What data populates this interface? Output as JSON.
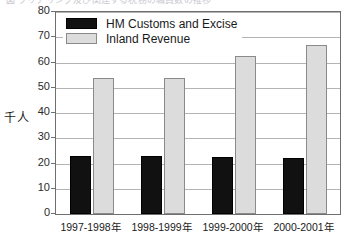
{
  "top_caption": {
    "ghost_text": "図 クリアリング及び関連する税務の職員数の推移"
  },
  "chart_data": {
    "type": "bar",
    "title": "",
    "subtitle": "",
    "xlabel": "",
    "ylabel": "千人",
    "ylim": [
      0,
      80
    ],
    "ytick_step": 10,
    "grid": true,
    "legend_position": "top-left",
    "categories": [
      "1997-1998年",
      "1998-1999年",
      "1999-2000年",
      "2000-2001年"
    ],
    "series": [
      {
        "name": "HM Customs and Excise",
        "color": "#111111",
        "values": [
          23,
          23,
          22.5,
          22
        ]
      },
      {
        "name": "Inland Revenue",
        "color": "#dcdcdc",
        "values": [
          54,
          54,
          62.5,
          67
        ]
      }
    ],
    "ytick_labels": [
      "0",
      "10",
      "20",
      "30",
      "40",
      "50",
      "60",
      "70",
      "80"
    ]
  },
  "legend": {
    "items": [
      {
        "label": "HM Customs and Excise"
      },
      {
        "label": "Inland Revenue"
      }
    ]
  }
}
